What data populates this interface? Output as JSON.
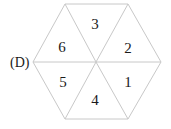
{
  "option_label": "(D)",
  "hexagon": {
    "center": [
      96,
      62
    ],
    "vertices": [
      [
        65,
        4
      ],
      [
        128,
        4
      ],
      [
        161,
        62
      ],
      [
        128,
        119
      ],
      [
        65,
        119
      ],
      [
        33,
        62
      ]
    ],
    "edge_color": "#c8c8c8"
  },
  "sections": [
    {
      "number": "3",
      "x": 95,
      "y": 29
    },
    {
      "number": "2",
      "x": 128,
      "y": 53
    },
    {
      "number": "6",
      "x": 62,
      "y": 52
    },
    {
      "number": "5",
      "x": 63,
      "y": 87
    },
    {
      "number": "1",
      "x": 128,
      "y": 87
    },
    {
      "number": "4",
      "x": 95,
      "y": 105
    }
  ]
}
